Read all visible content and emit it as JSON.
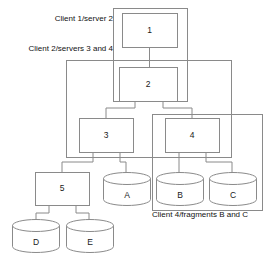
{
  "diagram": {
    "colors": {
      "stroke": "#8a8a8a",
      "fill": "#ffffff",
      "text": "#111111",
      "background": "#ffffff"
    },
    "groups": [
      {
        "id": "group-client1",
        "label": "Client 1/server 2",
        "label_x": 113,
        "label_y": 19,
        "label_anchor": "end",
        "x": 113,
        "y": 8,
        "w": 74,
        "h": 93
      },
      {
        "id": "group-client2",
        "label": "Client 2/servers 3 and 4",
        "label_x": 113,
        "label_y": 49,
        "label_anchor": "end",
        "x": 66,
        "y": 60,
        "w": 165,
        "h": 97
      },
      {
        "id": "group-client4",
        "label": "Client 4/fragments B and C",
        "label_x": 152,
        "label_y": 215,
        "label_anchor": "start",
        "x": 152,
        "y": 114,
        "w": 110,
        "h": 96
      }
    ],
    "nodes": [
      {
        "id": "node-1",
        "label": "1",
        "x": 122,
        "y": 13,
        "w": 55,
        "h": 34
      },
      {
        "id": "node-2",
        "label": "2",
        "x": 119,
        "y": 67,
        "w": 58,
        "h": 34
      },
      {
        "id": "node-3",
        "label": "3",
        "x": 79,
        "y": 118,
        "w": 54,
        "h": 34
      },
      {
        "id": "node-4",
        "label": "4",
        "x": 165,
        "y": 118,
        "w": 54,
        "h": 34
      },
      {
        "id": "node-5",
        "label": "5",
        "x": 35,
        "y": 172,
        "w": 54,
        "h": 33
      }
    ],
    "cylinders": [
      {
        "id": "cyl-a",
        "label": "A",
        "x": 103,
        "y": 172,
        "w": 47,
        "h": 33
      },
      {
        "id": "cyl-b",
        "label": "B",
        "x": 156,
        "y": 172,
        "w": 47,
        "h": 33
      },
      {
        "id": "cyl-c",
        "label": "C",
        "x": 209,
        "y": 172,
        "w": 47,
        "h": 33
      },
      {
        "id": "cyl-d",
        "label": "D",
        "x": 12,
        "y": 219,
        "w": 47,
        "h": 33
      },
      {
        "id": "cyl-e",
        "label": "E",
        "x": 66,
        "y": 219,
        "w": 47,
        "h": 33
      }
    ],
    "links": [
      {
        "id": "link-1-2",
        "from": "node-1",
        "to": "node-2",
        "path": "M 149.5 47 L 149.5 67"
      },
      {
        "id": "link-2-3",
        "from": "node-2",
        "to": "node-3",
        "path": "M 135 101 L 135 108 L 106 108 L 106 118"
      },
      {
        "id": "link-2-4",
        "from": "node-2",
        "to": "node-4",
        "path": "M 163 101 L 163 108 L 192 108 L 192 118"
      },
      {
        "id": "link-3-5",
        "from": "node-3",
        "to": "node-5",
        "path": "M 93 152 L 93 162 L 62 162 L 62 172"
      },
      {
        "id": "link-3-a",
        "from": "node-3",
        "to": "cyl-a",
        "path": "M 120 152 L 120 162 L 126 162 L 126 175"
      },
      {
        "id": "link-4-b",
        "from": "node-4",
        "to": "cyl-b",
        "path": "M 179 152 L 179 175"
      },
      {
        "id": "link-4-c",
        "from": "node-4",
        "to": "cyl-c",
        "path": "M 206 152 L 206 162 L 232 162 L 232 175"
      },
      {
        "id": "link-5-d",
        "from": "node-5",
        "to": "cyl-d",
        "path": "M 49 205 L 49 213 L 36 213 L 36 222"
      },
      {
        "id": "link-5-e",
        "from": "node-5",
        "to": "cyl-e",
        "path": "M 76 205 L 76 213 L 89 213 L 89 222"
      }
    ]
  }
}
